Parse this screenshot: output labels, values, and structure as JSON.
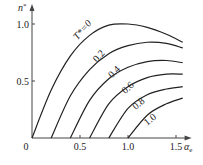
{
  "chart_data": {
    "type": "line",
    "title": "",
    "xlabel": "α_e",
    "ylabel": "n*",
    "xlim": [
      0,
      1.6
    ],
    "ylim": [
      0,
      1.05
    ],
    "x_ticks": [
      "0",
      "0.5",
      "1.0",
      "1.5"
    ],
    "y_ticks": [
      "0",
      "0.5",
      "1.0"
    ],
    "x_tick_values": [
      0,
      0.5,
      1.0,
      1.5
    ],
    "y_tick_values": [
      0,
      0.5,
      1.0
    ],
    "grid": false,
    "series": [
      {
        "name": "T*=0",
        "label": "T*=0",
        "x": [
          0,
          0.2,
          0.4,
          0.6,
          0.8,
          1.0,
          1.2,
          1.4,
          1.57
        ],
        "y": [
          0,
          0.42,
          0.72,
          0.9,
          0.99,
          1.0,
          0.97,
          0.91,
          0.84
        ]
      },
      {
        "name": "0.2",
        "label": "0.2",
        "x": [
          0.2,
          0.4,
          0.6,
          0.8,
          1.0,
          1.2,
          1.4,
          1.57
        ],
        "y": [
          0,
          0.37,
          0.6,
          0.74,
          0.81,
          0.84,
          0.83,
          0.79
        ]
      },
      {
        "name": "0.4",
        "label": "0.4",
        "x": [
          0.4,
          0.6,
          0.8,
          1.0,
          1.2,
          1.4,
          1.57
        ],
        "y": [
          0,
          0.33,
          0.52,
          0.62,
          0.67,
          0.68,
          0.66
        ]
      },
      {
        "name": "0.6",
        "label": "0.6",
        "x": [
          0.6,
          0.8,
          1.0,
          1.2,
          1.4,
          1.57
        ],
        "y": [
          0,
          0.3,
          0.45,
          0.53,
          0.56,
          0.56
        ]
      },
      {
        "name": "0.8",
        "label": "0.8",
        "x": [
          0.8,
          1.0,
          1.2,
          1.4,
          1.57
        ],
        "y": [
          0,
          0.26,
          0.38,
          0.43,
          0.45
        ]
      },
      {
        "name": "1.0",
        "label": "1.0",
        "x": [
          1.0,
          1.2,
          1.4,
          1.57
        ],
        "y": [
          0,
          0.2,
          0.3,
          0.35
        ]
      }
    ]
  }
}
